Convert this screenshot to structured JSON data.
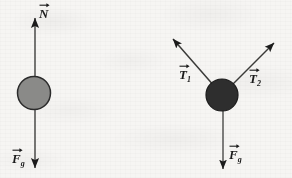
{
  "figure": {
    "background_color": "#f6f5f3",
    "ink_color": "#1b1b1b",
    "width": 292,
    "height": 178
  },
  "diagrams": [
    {
      "id": "left",
      "name": "ball-on-surface-free-body-diagram",
      "body": {
        "shape": "circle",
        "center_x": 34,
        "center_y": 93,
        "radius": 17,
        "fill_color": "#8a8a88",
        "stroke_color": "#2b2b2b"
      },
      "vectors": [
        {
          "name": "normal-force",
          "label": "N",
          "subscript": "",
          "direction": "up",
          "tail_x": 35,
          "tail_y": 93,
          "tip_x": 35,
          "tip_y": 15
        },
        {
          "name": "gravitational-force",
          "label": "F",
          "subscript": "g",
          "direction": "down",
          "tail_x": 35,
          "tail_y": 93,
          "tip_x": 35,
          "tip_y": 171
        }
      ]
    },
    {
      "id": "right",
      "name": "hanging-ball-two-tensions-free-body-diagram",
      "body": {
        "shape": "circle",
        "center_x": 222,
        "center_y": 95,
        "radius": 16,
        "fill_color": "#2e2e2e",
        "stroke_color": "#1b1b1b"
      },
      "vectors": [
        {
          "name": "tension-one",
          "label": "T",
          "subscript": "1",
          "direction": "up-left",
          "tail_x": 222,
          "tail_y": 95,
          "tip_x": 170,
          "tip_y": 36
        },
        {
          "name": "tension-two",
          "label": "T",
          "subscript": "2",
          "direction": "up-right",
          "tail_x": 222,
          "tail_y": 95,
          "tip_x": 277,
          "tip_y": 40
        },
        {
          "name": "gravitational-force",
          "label": "F",
          "subscript": "g",
          "direction": "down",
          "tail_x": 223,
          "tail_y": 95,
          "tip_x": 223,
          "tip_y": 172
        }
      ]
    }
  ],
  "labels": {
    "normal_left": "N",
    "fg_left_letter": "F",
    "fg_left_sub": "g",
    "t1_letter": "T",
    "t1_sub": "1",
    "t2_letter": "T",
    "t2_sub": "2",
    "fg_right_letter": "F",
    "fg_right_sub": "g"
  }
}
